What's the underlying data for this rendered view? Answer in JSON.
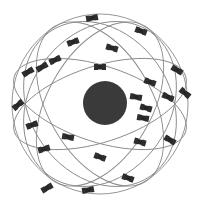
{
  "image": {
    "subject": "GPS satellite constellation illustration",
    "background_color": "#ffffff",
    "earth": {
      "cx": 105,
      "cy": 103,
      "r": 22,
      "color": "#3a3a3a"
    },
    "orbit_color": "#8a8a8a",
    "satellite_color": "#262626",
    "orbits": [
      {
        "cx": 100,
        "cy": 104,
        "rx": 88,
        "ry": 90,
        "rot": 0
      },
      {
        "cx": 100,
        "cy": 104,
        "rx": 90,
        "ry": 38,
        "rot": -18
      },
      {
        "cx": 100,
        "cy": 104,
        "rx": 90,
        "ry": 38,
        "rot": 18
      },
      {
        "cx": 100,
        "cy": 104,
        "rx": 90,
        "ry": 52,
        "rot": 60
      },
      {
        "cx": 100,
        "cy": 104,
        "rx": 90,
        "ry": 52,
        "rot": -60
      },
      {
        "cx": 100,
        "cy": 104,
        "rx": 70,
        "ry": 88,
        "rot": 35
      },
      {
        "cx": 100,
        "cy": 104,
        "rx": 70,
        "ry": 88,
        "rot": -35
      }
    ],
    "satellites": [
      {
        "x": 92,
        "y": 18,
        "angle": -10
      },
      {
        "x": 141,
        "y": 31,
        "angle": 20
      },
      {
        "x": 73,
        "y": 42,
        "angle": -20
      },
      {
        "x": 112,
        "y": 48,
        "angle": 15
      },
      {
        "x": 28,
        "y": 72,
        "angle": -30
      },
      {
        "x": 42,
        "y": 67,
        "angle": -30
      },
      {
        "x": 55,
        "y": 60,
        "angle": -25
      },
      {
        "x": 100,
        "y": 67,
        "angle": 0
      },
      {
        "x": 177,
        "y": 70,
        "angle": 30
      },
      {
        "x": 150,
        "y": 82,
        "angle": 20
      },
      {
        "x": 136,
        "y": 97,
        "angle": 10
      },
      {
        "x": 168,
        "y": 97,
        "angle": 25
      },
      {
        "x": 185,
        "y": 93,
        "angle": 40
      },
      {
        "x": 146,
        "y": 108,
        "angle": 15
      },
      {
        "x": 143,
        "y": 118,
        "angle": 10
      },
      {
        "x": 18,
        "y": 105,
        "angle": -40
      },
      {
        "x": 32,
        "y": 125,
        "angle": -20
      },
      {
        "x": 68,
        "y": 137,
        "angle": 10
      },
      {
        "x": 44,
        "y": 149,
        "angle": -15
      },
      {
        "x": 100,
        "y": 157,
        "angle": 20
      },
      {
        "x": 140,
        "y": 142,
        "angle": 15
      },
      {
        "x": 170,
        "y": 140,
        "angle": 30
      },
      {
        "x": 47,
        "y": 188,
        "angle": -30
      },
      {
        "x": 88,
        "y": 190,
        "angle": -10
      },
      {
        "x": 128,
        "y": 178,
        "angle": 20
      }
    ]
  }
}
